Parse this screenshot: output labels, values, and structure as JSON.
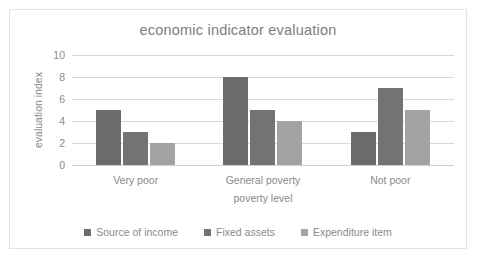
{
  "chart_data": {
    "type": "bar",
    "title": "economic indicator evaluation",
    "xlabel": "poverty level",
    "ylabel": "evaluation index",
    "categories": [
      "Very poor",
      "General poverty",
      "Not poor"
    ],
    "series": [
      {
        "name": "Source of income",
        "values": [
          5,
          8,
          3
        ],
        "color": "#6b6b6b"
      },
      {
        "name": "Fixed assets",
        "values": [
          3,
          5,
          7
        ],
        "color": "#737373"
      },
      {
        "name": "Expenditure item",
        "values": [
          2,
          4,
          5
        ],
        "color": "#a3a3a3"
      }
    ],
    "ylim": [
      0,
      10
    ],
    "yticks": [
      "0",
      "2",
      "4",
      "6",
      "8",
      "10"
    ],
    "grid": true,
    "legend_position": "bottom",
    "colors": {
      "text": "#8a8a8a",
      "title": "#7d7d7d",
      "gridline": "#d9d9d9",
      "border": "#e3e3e3",
      "background": "#ffffff"
    }
  }
}
